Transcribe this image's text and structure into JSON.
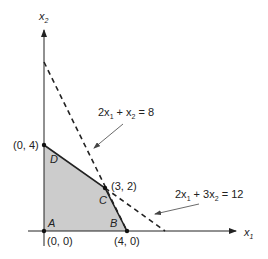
{
  "figure": {
    "type": "linear-programming-feasible-region",
    "axes": {
      "x_label": "x",
      "x_sub": "1",
      "y_label": "x",
      "y_sub": "2"
    },
    "constraints": [
      {
        "id": "c1",
        "label_parts": [
          "2x",
          "1",
          " + x",
          "2",
          " = 8"
        ],
        "equation": "2x1 + x2 = 8",
        "style": "dashed"
      },
      {
        "id": "c2",
        "label_parts": [
          "2x",
          "1",
          " + 3x",
          "2",
          " = 12"
        ],
        "equation": "2x1 + 3x2 = 12",
        "style": "dashed"
      }
    ],
    "vertices": [
      {
        "name": "A",
        "coord": "(0, 0)"
      },
      {
        "name": "B",
        "coord": "(4, 0)"
      },
      {
        "name": "C",
        "coord": "(3, 2)"
      },
      {
        "name": "D",
        "coord": "(0, 4)"
      }
    ],
    "colors": {
      "region_fill": "#cccccc",
      "line": "#222222",
      "background": "#ffffff"
    }
  }
}
